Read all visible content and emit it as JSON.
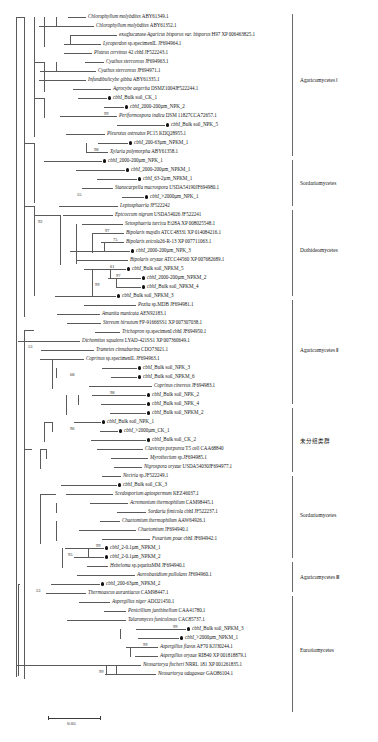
{
  "figure": {
    "type": "phylogenetic-tree",
    "scale_bar": {
      "label": "0.05",
      "length_px": 52
    },
    "tip_marker_legend": "filled circle = environmental clone sequence (cbhI)"
  },
  "clades": [
    {
      "id": "agaricomycetes-1",
      "label": "Agaricomycetes  Ⅰ",
      "top": 14,
      "bottom": 156,
      "label_y": 80
    },
    {
      "id": "sordariomycetes-1",
      "label": "Sordariomycetes",
      "top": 160,
      "bottom": 206,
      "label_y": 183
    },
    {
      "id": "dothideomycetes",
      "label": "Dothideomycetes",
      "top": 210,
      "bottom": 296,
      "label_y": 250
    },
    {
      "id": "agaricomycetes-2",
      "label": "Agaricomycetes  Ⅱ",
      "top": 300,
      "bottom": 404,
      "label_y": 350
    },
    {
      "id": "unclassified",
      "label": "未分组类群",
      "top": 408,
      "bottom": 472,
      "label_y": 440,
      "cjk": true
    },
    {
      "id": "sordariomycetes-2",
      "label": "Sordariomycetes",
      "top": 476,
      "bottom": 558,
      "label_y": 515
    },
    {
      "id": "agaricomycetes-3",
      "label": "Agaricomycetes  Ⅲ",
      "top": 562,
      "bottom": 592,
      "label_y": 577
    },
    {
      "id": "eurotiomycetes",
      "label": "Eurotiomycetes",
      "top": 596,
      "bottom": 712,
      "label_y": 650
    }
  ],
  "tips": [
    {
      "y": 17,
      "x": 88,
      "italic": "Chlorophyllum molybdites",
      "plain": " ABY61349.1",
      "clone": false
    },
    {
      "y": 26,
      "x": 96,
      "italic": "Chlorophyllum molybdites",
      "plain": " ABY61352.1",
      "clone": false
    },
    {
      "y": 35,
      "x": 119,
      "italic": "exoglucanase Agaricus bisporus var. bisporus",
      "plain": " H97 XP 006463825.1",
      "clone": false,
      "prefix_plain": "exoglucanase "
    },
    {
      "y": 44,
      "x": 103,
      "italic": "Lycoperdon",
      "plain": " sp.specimenIL JF694964.1",
      "clone": false
    },
    {
      "y": 53,
      "x": 94,
      "italic": "Pluteus cervinus",
      "plain": " 42 cbhI JF522243.1",
      "clone": false
    },
    {
      "y": 62,
      "x": 106,
      "italic": "Cyathus stercoreus",
      "plain": " JF694963.1",
      "clone": false
    },
    {
      "y": 71,
      "x": 98,
      "italic": "Cyathus stercoreus",
      "plain": " JF694971.1",
      "clone": false
    },
    {
      "y": 80,
      "x": 88,
      "italic": "Infundibulicybe gibba",
      "plain": " ABY61335.1",
      "clone": false
    },
    {
      "y": 89,
      "x": 113,
      "italic": "Agrocybe aegerita",
      "plain": " DSMZ1004JF522244.1",
      "clone": false
    },
    {
      "y": 98,
      "x": 113,
      "italic": "cbhI",
      "plain": "_Bulk soil_CK_1",
      "clone": true
    },
    {
      "y": 107,
      "x": 130,
      "italic": "cbhI",
      "plain": "_2000-200µm_NPK_2",
      "clone": true
    },
    {
      "y": 116,
      "x": 119,
      "italic": "Periformospora indica",
      "plain": " DSM 11827CCA72657.1",
      "clone": false
    },
    {
      "y": 125,
      "x": 171,
      "italic": "cbhI",
      "plain": "_Bulk soil_NPK_5",
      "clone": true
    },
    {
      "y": 134,
      "x": 107,
      "italic": "Pleurotus ostreatus",
      "plain": " PC15 KDQ28955.1",
      "clone": false
    },
    {
      "y": 143,
      "x": 134,
      "italic": "cbhI",
      "plain": "_200-63µm_NPKM_1",
      "clone": true
    },
    {
      "y": 152,
      "x": 110,
      "italic": "Xylaria polymorpha",
      "plain": " ABY61358.1",
      "clone": false
    },
    {
      "y": 161,
      "x": 108,
      "italic": "cbhI",
      "plain": "_2000-200µm_NPK_1",
      "clone": true
    },
    {
      "y": 170,
      "x": 131,
      "italic": "cbhI",
      "plain": "_2000-200µm_NPKM_1",
      "clone": true
    },
    {
      "y": 179,
      "x": 143,
      "italic": "cbhI",
      "plain": "_63-2µm_NPKM_1",
      "clone": true
    },
    {
      "y": 188,
      "x": 115,
      "italic": "Stanocarpella macrospora",
      "plain": " USDA54190JF694980.1",
      "clone": false
    },
    {
      "y": 197,
      "x": 150,
      "italic": "cbhI",
      "plain": "_>2000µm_NPK_1",
      "clone": true
    },
    {
      "y": 206,
      "x": 120,
      "italic": "Leptosphaeria",
      "plain": " JF522242",
      "clone": false
    },
    {
      "y": 215,
      "x": 115,
      "italic": "Epicoccum nigrum",
      "plain": " USDA54026 JF522241",
      "clone": false
    },
    {
      "y": 224,
      "x": 125,
      "italic": "Setosphaeria turcica",
      "plain": " Et28A XP 008025548.1",
      "clone": false
    },
    {
      "y": 233,
      "x": 126,
      "italic": "Bipolaris maydis",
      "plain": " ATCC48331 XP 014084216.1",
      "clone": false
    },
    {
      "y": 242,
      "x": 126,
      "italic": "Bipolaris zeicola",
      "plain": "26-R-13 XP 007711063.1",
      "clone": false
    },
    {
      "y": 251,
      "x": 136,
      "italic": "cbhI",
      "plain": "_2000-200µm_NPK_3",
      "clone": true
    },
    {
      "y": 260,
      "x": 130,
      "italic": "Bipolaris oryzae",
      "plain": " ATCC44560 XP 007682689.1",
      "clone": false
    },
    {
      "y": 269,
      "x": 132,
      "italic": "cbhI",
      "plain": "_Bulk soil_NPKM_5",
      "clone": true
    },
    {
      "y": 278,
      "x": 147,
      "italic": "cbhI",
      "plain": "_2000-200µm_NPKM_2",
      "clone": true
    },
    {
      "y": 287,
      "x": 147,
      "italic": "cbhI",
      "plain": "_Bulk soil_NPKM_4",
      "clone": true
    },
    {
      "y": 296,
      "x": 122,
      "italic": "cbhI",
      "plain": "_Bulk soil_NPKM_3",
      "clone": true
    },
    {
      "y": 305,
      "x": 138,
      "italic": "Pezita",
      "plain": " sp.MDB JF694981.1",
      "clone": false
    },
    {
      "y": 314,
      "x": 102,
      "italic": "Amanita manicata",
      "plain": " AEN92183.1",
      "clone": false
    },
    {
      "y": 323,
      "x": 103,
      "italic": "Stereum hirsutum",
      "plain": " FP-91666SS1 XP 007307038.1",
      "clone": false
    },
    {
      "y": 332,
      "x": 122,
      "italic": "Trichopron",
      "plain": " sp.specimenI cbhI JF694950.1",
      "clone": false
    },
    {
      "y": 341,
      "x": 82,
      "italic": "Dichomitus squalens",
      "plain": " LYAD-421SS1 XP 007360649.1",
      "clone": false
    },
    {
      "y": 350,
      "x": 96,
      "italic": "Trametes cinnabarina",
      "plain": " CDO73021.1",
      "clone": false
    },
    {
      "y": 359,
      "x": 86,
      "italic": "Coprinus",
      "plain": " sp.specimenIL JF694963.1",
      "clone": false
    },
    {
      "y": 368,
      "x": 143,
      "italic": "cbhI",
      "plain": "_Bulk soil_NPK_3",
      "clone": true
    },
    {
      "y": 377,
      "x": 143,
      "italic": "cbhI",
      "plain": "_Bulk soil_NPKM_6",
      "clone": true
    },
    {
      "y": 386,
      "x": 154,
      "italic": "Coprinus cinereus",
      "plain": " JF694983.1",
      "clone": false
    },
    {
      "y": 395,
      "x": 152,
      "italic": "cbhI",
      "plain": "_Bulk soil_NPK_2",
      "clone": true
    },
    {
      "y": 404,
      "x": 152,
      "italic": "cbhI",
      "plain": "_Bulk soil_NPK_4",
      "clone": true
    },
    {
      "y": 413,
      "x": 152,
      "italic": "cbhI",
      "plain": "_Bulk soil_NPKM_2",
      "clone": true
    },
    {
      "y": 422,
      "x": 107,
      "italic": "cbhI",
      "plain": "_Bulk soil_NPK_1",
      "clone": true
    },
    {
      "y": 431,
      "x": 124,
      "italic": "cbhI",
      "plain": "_>2000µm_CK_1",
      "clone": true
    },
    {
      "y": 440,
      "x": 152,
      "italic": "cbhI",
      "plain": "_Bulk soil_CK_2",
      "clone": true
    },
    {
      "y": 449,
      "x": 145,
      "italic": "Claviceps purpurea",
      "plain": " T5 cell CAA68840",
      "clone": false
    },
    {
      "y": 458,
      "x": 150,
      "italic": "Myrothecium",
      "plain": " sp.JF694985.1",
      "clone": false
    },
    {
      "y": 467,
      "x": 144,
      "italic": "Nigrospora oryzae",
      "plain": " USDA54030JF694977.1",
      "clone": false
    },
    {
      "y": 476,
      "x": 123,
      "italic": "Nectria",
      "plain": " sp.JF522249.1",
      "clone": false
    },
    {
      "y": 485,
      "x": 123,
      "italic": "cbhI",
      "plain": "_Bulk soil_CK_3",
      "clone": true
    },
    {
      "y": 494,
      "x": 115,
      "italic": "Scedosporium apiospermum",
      "plain": " KEZ46037.1",
      "clone": false
    },
    {
      "y": 503,
      "x": 130,
      "italic": "Acremonium thermophilum",
      "plain": " CAM98445.1",
      "clone": false
    },
    {
      "y": 512,
      "x": 148,
      "italic": "Sordaria fimicola",
      "plain": " cbhI  JF522237.1",
      "clone": false
    },
    {
      "y": 521,
      "x": 122,
      "italic": "Chaetomium thermophilum",
      "plain": " AAW64926.1",
      "clone": false
    },
    {
      "y": 530,
      "x": 138,
      "italic": "Chaetomium",
      "plain": " JF694940.1",
      "clone": false
    },
    {
      "y": 539,
      "x": 152,
      "italic": "Fusarium poae",
      "plain": " cbhI JF694942.1",
      "clone": false
    },
    {
      "y": 548,
      "x": 110,
      "italic": "cbhI",
      "plain": "_2-0.1µm_NPKM_1",
      "clone": true
    },
    {
      "y": 557,
      "x": 110,
      "italic": "cbhI",
      "plain": "_2-0.1µm_NPKM_2",
      "clone": true
    },
    {
      "y": 566,
      "x": 110,
      "italic": "Hebeloma",
      "plain": " sp.pquritaMM JF694940.1",
      "clone": false
    },
    {
      "y": 575,
      "x": 137,
      "italic": "Aureobasidium pullulans",
      "plain": " JF694960.1",
      "clone": false
    },
    {
      "y": 584,
      "x": 106,
      "italic": "cbhI",
      "plain": "_200-63µm_NPKM_2",
      "clone": true
    },
    {
      "y": 593,
      "x": 88,
      "italic": "Thermoascus aurantiacus",
      "plain": " CAM98447.1",
      "clone": false
    },
    {
      "y": 602,
      "x": 112,
      "italic": "Aspergillus niger",
      "plain": " ADO21450.1",
      "clone": false
    },
    {
      "y": 611,
      "x": 128,
      "italic": "Penicillium janthinellum",
      "plain": " CAA41780.1",
      "clone": false
    },
    {
      "y": 620,
      "x": 128,
      "italic": "Talaromyces funiculosus",
      "plain": " CAC85737.1",
      "clone": false
    },
    {
      "y": 629,
      "x": 192,
      "italic": "cbhI",
      "plain": "_Bulk soil_NPKM_3",
      "clone": true
    },
    {
      "y": 638,
      "x": 185,
      "italic": "cbhI",
      "plain": "_>2000µm_NPKM_1",
      "clone": true
    },
    {
      "y": 647,
      "x": 160,
      "italic": "Aspergillus flavus",
      "plain": " AF70 KJJ30244.1",
      "clone": false
    },
    {
      "y": 656,
      "x": 160,
      "italic": "Aspergillus oryzae",
      "plain": " RIB40 XP 001818879.1",
      "clone": false
    },
    {
      "y": 665,
      "x": 143,
      "italic": "Neosartorya fischeri",
      "plain": " NRRL 181 XP 001261835.1",
      "clone": false
    },
    {
      "y": 674,
      "x": 158,
      "italic": "Neosartorya udagawae",
      "plain": " GAO86104.1",
      "clone": false
    }
  ],
  "bootstraps": [
    {
      "value": "99",
      "x": 104,
      "y": 114
    },
    {
      "value": "98",
      "x": 94,
      "y": 150
    },
    {
      "value": "55",
      "x": 77,
      "y": 195
    },
    {
      "value": "92",
      "x": 38,
      "y": 222
    },
    {
      "value": "97",
      "x": 105,
      "y": 231
    },
    {
      "value": "75",
      "x": 113,
      "y": 240
    },
    {
      "value": "61",
      "x": 110,
      "y": 267
    },
    {
      "value": "97",
      "x": 116,
      "y": 276
    },
    {
      "value": "99",
      "x": 95,
      "y": 285
    },
    {
      "value": "53",
      "x": 28,
      "y": 347
    },
    {
      "value": "68",
      "x": 70,
      "y": 375
    },
    {
      "value": "98",
      "x": 110,
      "y": 393
    },
    {
      "value": "96",
      "x": 70,
      "y": 429
    },
    {
      "value": "99",
      "x": 96,
      "y": 546
    },
    {
      "value": "95",
      "x": 68,
      "y": 555
    },
    {
      "value": "53",
      "x": 36,
      "y": 591
    },
    {
      "value": "99",
      "x": 173,
      "y": 627
    },
    {
      "value": "99",
      "x": 143,
      "y": 645
    },
    {
      "value": "99",
      "x": 99,
      "y": 672
    }
  ],
  "edges": {
    "horizontal": [
      [
        58,
        17,
        30
      ],
      [
        60,
        26,
        36
      ],
      [
        70,
        35,
        49
      ],
      [
        57,
        44,
        46
      ],
      [
        30,
        53,
        64
      ],
      [
        62,
        62,
        44
      ],
      [
        62,
        71,
        36
      ],
      [
        30,
        80,
        58
      ],
      [
        54,
        89,
        59
      ],
      [
        44,
        98,
        69
      ],
      [
        108,
        107,
        22
      ],
      [
        96,
        116,
        23
      ],
      [
        32,
        125,
        139
      ],
      [
        30,
        134,
        77
      ],
      [
        86,
        143,
        48
      ],
      [
        86,
        152,
        24
      ],
      [
        30,
        161,
        78
      ],
      [
        30,
        170,
        101
      ],
      [
        30,
        179,
        113
      ],
      [
        30,
        188,
        85
      ],
      [
        84,
        197,
        66
      ],
      [
        72,
        206,
        48
      ],
      [
        47,
        215,
        68
      ],
      [
        75,
        224,
        50
      ],
      [
        82,
        233,
        44
      ],
      [
        82,
        242,
        44
      ],
      [
        96,
        251,
        40
      ],
      [
        96,
        260,
        34
      ],
      [
        102,
        269,
        30
      ],
      [
        122,
        278,
        25
      ],
      [
        122,
        287,
        25
      ],
      [
        90,
        296,
        32
      ],
      [
        96,
        305,
        42
      ],
      [
        22,
        314,
        80
      ],
      [
        22,
        323,
        81
      ],
      [
        36,
        332,
        86
      ],
      [
        20,
        341,
        62
      ],
      [
        20,
        350,
        76
      ],
      [
        22,
        359,
        64
      ],
      [
        56,
        368,
        87
      ],
      [
        56,
        377,
        87
      ],
      [
        70,
        386,
        84
      ],
      [
        78,
        395,
        74
      ],
      [
        78,
        404,
        74
      ],
      [
        22,
        413,
        130
      ],
      [
        52,
        422,
        55
      ],
      [
        52,
        431,
        72
      ],
      [
        22,
        440,
        130
      ],
      [
        46,
        449,
        99
      ],
      [
        46,
        458,
        104
      ],
      [
        36,
        467,
        108
      ],
      [
        30,
        476,
        93
      ],
      [
        30,
        485,
        93
      ],
      [
        36,
        494,
        79
      ],
      [
        60,
        503,
        70
      ],
      [
        60,
        512,
        88
      ],
      [
        60,
        521,
        62
      ],
      [
        60,
        530,
        78
      ],
      [
        60,
        539,
        92
      ],
      [
        88,
        548,
        22
      ],
      [
        88,
        557,
        22
      ],
      [
        74,
        566,
        36
      ],
      [
        20,
        575,
        117
      ],
      [
        20,
        584,
        86
      ],
      [
        20,
        593,
        68
      ],
      [
        20,
        602,
        92
      ],
      [
        20,
        611,
        108
      ],
      [
        20,
        620,
        108
      ],
      [
        166,
        629,
        26
      ],
      [
        166,
        638,
        19
      ],
      [
        136,
        647,
        24
      ],
      [
        136,
        656,
        24
      ],
      [
        126,
        665,
        17
      ],
      [
        110,
        674,
        48
      ]
    ],
    "vertical": [
      [
        58,
        17,
        9
      ],
      [
        70,
        35,
        9
      ],
      [
        62,
        62,
        9
      ],
      [
        108,
        107,
        9
      ],
      [
        86,
        143,
        9
      ],
      [
        96,
        251,
        9
      ],
      [
        122,
        278,
        9
      ],
      [
        96,
        305,
        9
      ],
      [
        20,
        341,
        9
      ],
      [
        56,
        368,
        9
      ],
      [
        78,
        395,
        9
      ],
      [
        52,
        422,
        9
      ],
      [
        46,
        449,
        9
      ],
      [
        88,
        548,
        9
      ],
      [
        166,
        629,
        9
      ],
      [
        136,
        647,
        9
      ],
      [
        110,
        665,
        9
      ],
      [
        44,
        17,
        9
      ],
      [
        30,
        53,
        9
      ],
      [
        30,
        80,
        9
      ],
      [
        32,
        116,
        9
      ],
      [
        22,
        314,
        9
      ],
      [
        22,
        359,
        9
      ],
      [
        22,
        413,
        9
      ],
      [
        36,
        332,
        9
      ],
      [
        36,
        467,
        9
      ],
      [
        30,
        476,
        9
      ],
      [
        60,
        503,
        9
      ],
      [
        20,
        575,
        9
      ]
    ]
  }
}
